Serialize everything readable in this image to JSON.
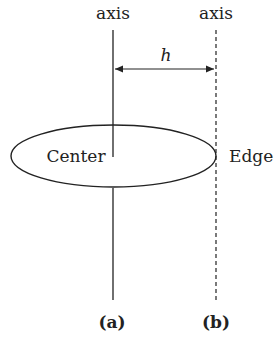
{
  "labels": {
    "axis_left": "axis",
    "axis_right": "axis",
    "distance": "h",
    "center": "Center",
    "edge": "Edge",
    "panel_a": "(a)",
    "panel_b": "(b)"
  },
  "colors": {
    "line": "#222222",
    "background": "#ffffff"
  }
}
